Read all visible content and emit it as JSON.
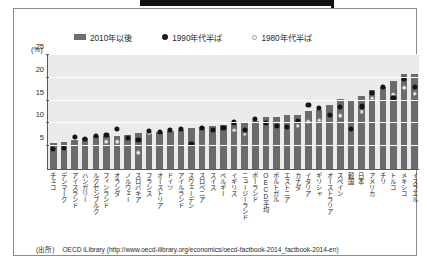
{
  "legend": {
    "items": [
      {
        "label": "2010年以後",
        "marker": "bar-swatch"
      },
      {
        "label": "1990年代半ば",
        "marker": "filled-dot"
      },
      {
        "label": "1980年代半ば",
        "marker": "open-dot"
      }
    ]
  },
  "axis": {
    "unit_label": "(%)"
  },
  "source": {
    "tag": "(出所)",
    "text": "OECD iLibrary (http://www.oecd-ilibrary.org/economics/oecd-factbook-2014_factbook-2014-en)"
  },
  "chart_data": {
    "type": "bar",
    "title": "",
    "xlabel": "",
    "ylabel": "(%)",
    "ylim": [
      0,
      25
    ],
    "yticks": [
      5,
      10,
      15,
      20,
      25
    ],
    "grid": true,
    "legend_position": "top",
    "categories": [
      "チェコ",
      "デンマーク",
      "アイスランド",
      "ハンガリー",
      "ルクセンブルク",
      "フィンランド",
      "オランダ",
      "ノルウェー",
      "スロバキア",
      "フランス",
      "オーストリア",
      "ドイツ",
      "アイルランド",
      "スウェーデン",
      "スロベニア",
      "スイス",
      "ベルギー",
      "イギリス",
      "ニュージーランド",
      "ポーランド",
      "OECD平均",
      "ポルトガル",
      "エストニア",
      "カナダ",
      "イタリア",
      "ギリシャ",
      "オーストラリア",
      "スペイン",
      "韓国",
      "日本",
      "アメリカ",
      "チリ",
      "トルコ",
      "メキシコ",
      "イスラエル"
    ],
    "series": [
      {
        "name": "2010年以後",
        "type": "bar",
        "values": [
          5.8,
          6.0,
          6.4,
          6.8,
          7.2,
          7.2,
          7.3,
          7.5,
          7.8,
          8.0,
          8.1,
          8.4,
          8.6,
          9.0,
          9.2,
          9.5,
          9.7,
          10.0,
          10.3,
          10.5,
          11.3,
          11.5,
          11.8,
          11.9,
          12.7,
          13.0,
          14.0,
          15.4,
          14.9,
          16.0,
          17.4,
          18.0,
          19.3,
          20.9,
          20.9
        ]
      },
      {
        "name": "1990年代半ば",
        "type": "scatter",
        "values": [
          4.4,
          4.6,
          7.0,
          6.5,
          7.2,
          7.5,
          8.8,
          6.8,
          6.3,
          8.3,
          8.1,
          8.6,
          8.7,
          5.5,
          8.9,
          8.6,
          9.0,
          10.2,
          8.5,
          11.0,
          10.0,
          9.5,
          9.2,
          10.5,
          14.0,
          13.3,
          11.9,
          13.5,
          8.7,
          13.7,
          16.7,
          18.0,
          15.6,
          19.7,
          17.9
        ]
      },
      {
        "name": "1980年代半ば",
        "type": "scatter",
        "values": [
          null,
          4.6,
          null,
          null,
          7.0,
          6.0,
          6.0,
          null,
          3.5,
          7.8,
          null,
          null,
          null,
          5.2,
          null,
          null,
          null,
          8.5,
          7.6,
          null,
          null,
          null,
          null,
          9.5,
          10.3,
          10.7,
          null,
          11.7,
          null,
          12.5,
          15.5,
          null,
          16.4,
          17.8,
          16.5
        ]
      }
    ]
  }
}
